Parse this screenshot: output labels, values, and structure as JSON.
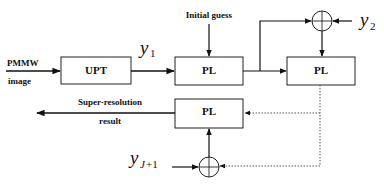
{
  "diagram": {
    "input_label_line1": "PMMW",
    "input_label_line2": "image",
    "initial_guess": "Initial guess",
    "blocks": {
      "upt": "UPT",
      "pl1": "PL",
      "pl2": "PL",
      "pl3": "PL"
    },
    "signals": {
      "y1_base": "y",
      "y1_sub": "1",
      "y2_base": "y",
      "y2_sub": "2",
      "yj_base": "y",
      "yj_sub_var": "J",
      "yj_sub_rest": "+1"
    },
    "output_label_line1": "Super-resolution",
    "output_label_line2": "result"
  }
}
